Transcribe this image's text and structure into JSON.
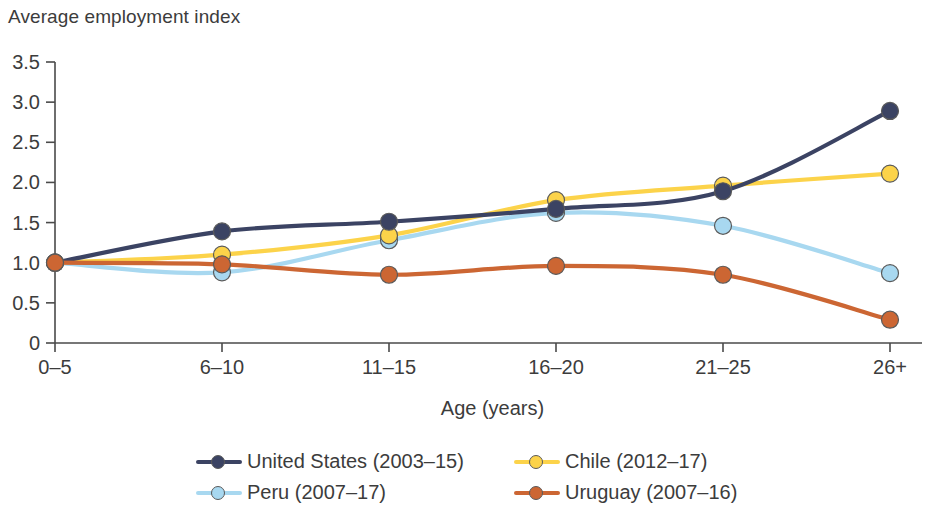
{
  "chart_data": {
    "type": "line",
    "title": "Average employment index",
    "xlabel": "Age (years)",
    "ylabel": "",
    "categories": [
      "0–5",
      "6–10",
      "11–15",
      "16–20",
      "21–25",
      "26+"
    ],
    "ylim": [
      0,
      3.5
    ],
    "ytick_labels": [
      "0",
      "0.5",
      "1.0",
      "1.5",
      "2.0",
      "2.5",
      "3.0",
      "3.5"
    ],
    "ytick_values": [
      0,
      0.5,
      1.0,
      1.5,
      2.0,
      2.5,
      3.0,
      3.5
    ],
    "grid": false,
    "legend_position": "bottom",
    "series": [
      {
        "name": "United States (2003–15)",
        "color": "#3b4363",
        "values": [
          1.0,
          1.39,
          1.51,
          1.67,
          1.89,
          2.89
        ]
      },
      {
        "name": "Chile (2012–17)",
        "color": "#fcd34a",
        "values": [
          1.0,
          1.1,
          1.34,
          1.78,
          1.96,
          2.11
        ]
      },
      {
        "name": "Peru (2007–17)",
        "color": "#a8d8f0",
        "values": [
          1.0,
          0.88,
          1.28,
          1.62,
          1.46,
          0.87
        ]
      },
      {
        "name": "Uruguay (2007–16)",
        "color": "#cc6633",
        "values": [
          1.0,
          0.98,
          0.85,
          0.96,
          0.85,
          0.29
        ]
      }
    ]
  },
  "legend": {
    "entries": [
      {
        "label": "United States (2003–15)",
        "color": "#3b4363"
      },
      {
        "label": "Peru (2007–17)",
        "color": "#a8d8f0"
      },
      {
        "label": "Chile (2012–17)",
        "color": "#fcd34a"
      },
      {
        "label": "Uruguay (2007–16)",
        "color": "#cc6633"
      }
    ]
  }
}
